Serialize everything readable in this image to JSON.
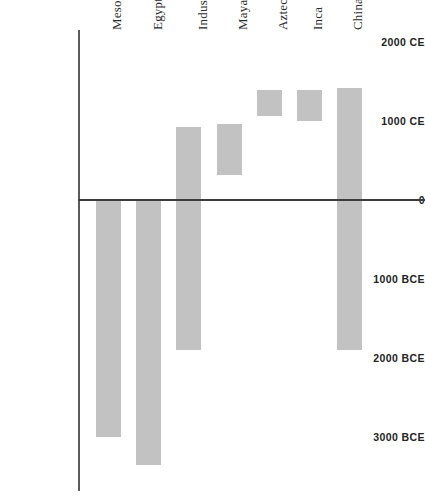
{
  "chart_data": {
    "type": "bar",
    "title": "",
    "subtitle": "",
    "xlabel": "",
    "ylabel": "",
    "orientation": "vertical-range",
    "grid": false,
    "legend": false,
    "ylim": [
      -3500,
      2000
    ],
    "y_axis_direction": "time",
    "y_ticks": [
      {
        "label": "2000 CE",
        "value": 2000
      },
      {
        "label": "1000 CE",
        "value": 1000
      },
      {
        "label": "0",
        "value": 0
      },
      {
        "label": "1000 BCE",
        "value": -1000
      },
      {
        "label": "2000 BCE",
        "value": -2000
      },
      {
        "label": "3000 BCE",
        "value": -3000
      }
    ],
    "categories": [
      "Mesopotamia",
      "Egypt",
      "Indus Valley",
      "Maya",
      "Aztec",
      "Inca",
      "China"
    ],
    "bars": [
      {
        "name": "Mesopotamia",
        "start": -3000,
        "end": 0
      },
      {
        "name": "Egypt",
        "start": -3350,
        "end": 0
      },
      {
        "name": "Indus Valley",
        "start": -1900,
        "end": 920
      },
      {
        "name": "Maya",
        "start": 320,
        "end": 960
      },
      {
        "name": "Aztec",
        "start": 1060,
        "end": 1390
      },
      {
        "name": "Inca",
        "start": 1000,
        "end": 1390
      },
      {
        "name": "China",
        "start": -1900,
        "end": 1420
      }
    ],
    "colors": {
      "bar_fill": "#c2c2c2",
      "axis": "#5a5a5a",
      "zero_line": "#3c3c3c",
      "tick_text": "#232323",
      "category_text": "#2b2b2b",
      "background": "#ffffff"
    }
  }
}
